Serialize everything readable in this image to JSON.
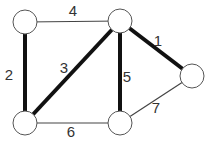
{
  "graph": {
    "title": "Weighted graph with minimum spanning tree highlighted",
    "colors": {
      "mst_edge": "#111111",
      "normal_edge": "#444444",
      "node_stroke": "#555555",
      "label": "#333333"
    },
    "nodes": [
      {
        "id": "A",
        "x": 25,
        "y": 22,
        "r": 12
      },
      {
        "id": "B",
        "x": 120,
        "y": 21,
        "r": 12
      },
      {
        "id": "C",
        "x": 192,
        "y": 76,
        "r": 12
      },
      {
        "id": "D",
        "x": 25,
        "y": 123,
        "r": 12
      },
      {
        "id": "E",
        "x": 120,
        "y": 123,
        "r": 12
      }
    ],
    "edges": [
      {
        "from": "A",
        "to": "B",
        "weight": "4",
        "mst": false,
        "label_x": 73,
        "label_y": 16
      },
      {
        "from": "A",
        "to": "D",
        "weight": "2",
        "mst": true,
        "label_x": 9,
        "label_y": 80
      },
      {
        "from": "B",
        "to": "D",
        "weight": "3",
        "mst": true,
        "label_x": 64,
        "label_y": 73
      },
      {
        "from": "B",
        "to": "C",
        "weight": "1",
        "mst": true,
        "label_x": 158,
        "label_y": 46
      },
      {
        "from": "B",
        "to": "E",
        "weight": "5",
        "mst": true,
        "label_x": 127,
        "label_y": 82
      },
      {
        "from": "D",
        "to": "E",
        "weight": "6",
        "mst": false,
        "label_x": 71,
        "label_y": 137
      },
      {
        "from": "E",
        "to": "C",
        "weight": "7",
        "mst": false,
        "label_x": 156,
        "label_y": 113
      }
    ]
  }
}
